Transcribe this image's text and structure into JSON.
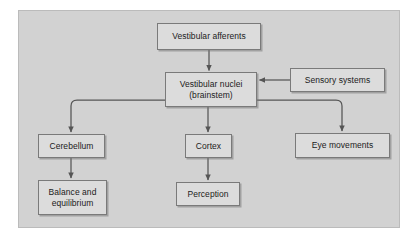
{
  "figure": {
    "panel": {
      "background_color": "#d2d2d2",
      "page_background_color": "#ffffff"
    },
    "style": {
      "node_fill": "#dcdcdc",
      "node_border": "#7a7a7a",
      "connector_color": "#555555",
      "text_color": "#1b1b1b"
    }
  },
  "nodes": [
    {
      "id": "vestibular-afferents",
      "label": "Vestibular afferents"
    },
    {
      "id": "vestibular-nuclei",
      "label": "Vestibular nuclei\n(brainstem)"
    },
    {
      "id": "sensory-systems",
      "label": "Sensory systems"
    },
    {
      "id": "cerebellum",
      "label": "Cerebellum"
    },
    {
      "id": "cortex",
      "label": "Cortex"
    },
    {
      "id": "eye-movements",
      "label": "Eye movements"
    },
    {
      "id": "balance-equilibrium",
      "label": "Balance and\nequilibrium"
    },
    {
      "id": "perception",
      "label": "Perception"
    }
  ],
  "connectors": [
    {
      "id": "afferents-to-nuclei",
      "from": "vestibular-afferents",
      "to": "vestibular-nuclei",
      "shape": "straight-down"
    },
    {
      "id": "sensory-to-nuclei",
      "from": "sensory-systems",
      "to": "vestibular-nuclei",
      "shape": "straight-left"
    },
    {
      "id": "nuclei-to-cerebellum",
      "from": "vestibular-nuclei",
      "to": "cerebellum",
      "shape": "elbow-left-down"
    },
    {
      "id": "nuclei-to-cortex",
      "from": "vestibular-nuclei",
      "to": "cortex",
      "shape": "straight-down"
    },
    {
      "id": "nuclei-to-eye",
      "from": "vestibular-nuclei",
      "to": "eye-movements",
      "shape": "elbow-right-down"
    },
    {
      "id": "cerebellum-to-balance",
      "from": "cerebellum",
      "to": "balance-equilibrium",
      "shape": "straight-down"
    },
    {
      "id": "cortex-to-perception",
      "from": "cortex",
      "to": "perception",
      "shape": "straight-down"
    }
  ]
}
